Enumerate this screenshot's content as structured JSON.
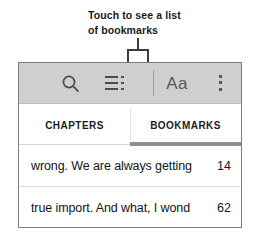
{
  "annotation": {
    "line1": "Touch to see a list",
    "line2": "of bookmarks",
    "leader_target_primary": "list-icon",
    "leader_target_secondary": "bookmarks-tab"
  },
  "toolbar": {
    "search_icon": "search-icon",
    "list_icon": "list-icon",
    "font_size_label": "Aa",
    "overflow_icon": "more-vertical-icon",
    "background_color": "#cfcfcf"
  },
  "tabs": {
    "items": [
      {
        "label": "CHAPTERS",
        "selected": false
      },
      {
        "label": "BOOKMARKS",
        "selected": true
      }
    ],
    "indicator_color": "#8e8e8e"
  },
  "bookmarks": {
    "rows": [
      {
        "text": "wrong. We are always getting",
        "page": "14"
      },
      {
        "text": "true import. And what, I wond",
        "page": "62"
      }
    ]
  },
  "colors": {
    "panel_border": "#7e7e7e",
    "leader_line": "#3c3c3c",
    "text": "#141414"
  }
}
